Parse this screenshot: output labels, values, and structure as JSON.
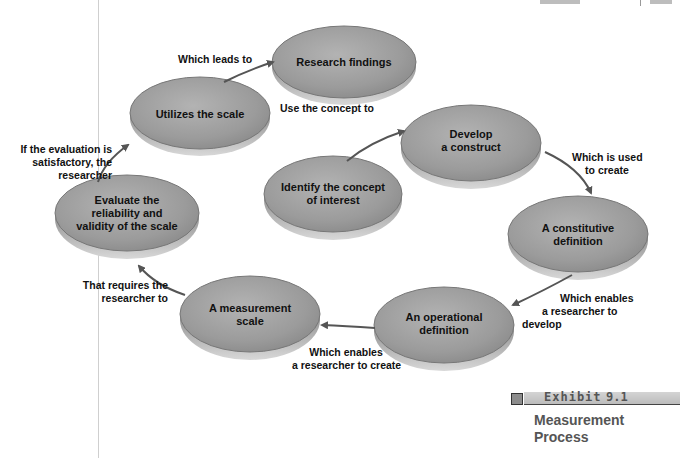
{
  "figure": {
    "exhibit_label": "Exhibit",
    "exhibit_number": "9.1",
    "caption_line1": "Measurement",
    "caption_line2": "Process"
  },
  "colors": {
    "node_fill": "#9a9a9a",
    "node_edge": "#6b6b6b",
    "arrow": "#555555",
    "text": "#111111"
  },
  "nodes": [
    {
      "id": "identify",
      "label_lines": [
        "Identify the concept",
        "of interest"
      ]
    },
    {
      "id": "construct",
      "label_lines": [
        "Develop",
        "a construct"
      ]
    },
    {
      "id": "constitutive",
      "label_lines": [
        "A constitutive",
        "definition"
      ]
    },
    {
      "id": "operational",
      "label_lines": [
        "An operational",
        "definition"
      ]
    },
    {
      "id": "scale",
      "label_lines": [
        "A measurement",
        "scale"
      ]
    },
    {
      "id": "evaluate",
      "label_lines": [
        "Evaluate the",
        "reliability and",
        "validity of the scale"
      ]
    },
    {
      "id": "utilize",
      "label_lines": [
        "Utilizes the scale"
      ]
    },
    {
      "id": "findings",
      "label_lines": [
        "Research findings"
      ]
    }
  ],
  "edges": [
    {
      "from": "identify",
      "to": "construct",
      "label_lines": [
        "Use the concept to"
      ]
    },
    {
      "from": "construct",
      "to": "constitutive",
      "label_lines": [
        "Which is used",
        "to create"
      ]
    },
    {
      "from": "constitutive",
      "to": "operational",
      "label_lines": [
        "Which enables",
        "a researcher to",
        "develop"
      ]
    },
    {
      "from": "operational",
      "to": "scale",
      "label_lines": [
        "Which enables",
        "a researcher to create"
      ]
    },
    {
      "from": "scale",
      "to": "evaluate",
      "label_lines": [
        "That requires the",
        "researcher to"
      ]
    },
    {
      "from": "evaluate",
      "to": "utilize",
      "label_lines": [
        "If the evaluation is",
        "satisfactory, the",
        "researcher"
      ]
    },
    {
      "from": "utilize",
      "to": "findings",
      "label_lines": [
        "Which leads to"
      ]
    }
  ]
}
